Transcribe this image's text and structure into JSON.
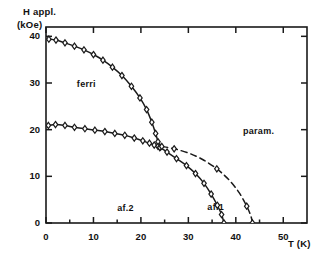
{
  "chart_data": {
    "type": "line",
    "title": "",
    "subtitle": "",
    "xlabel": "T (K)",
    "ylabel_line1": "H appl.",
    "ylabel_line2": "(kOe)",
    "xlim": [
      0,
      55
    ],
    "ylim": [
      0,
      42
    ],
    "xticks": [
      0,
      10,
      20,
      30,
      40,
      50
    ],
    "xtick_labels": [
      "0",
      "10",
      "20",
      "30",
      "40",
      "50"
    ],
    "yticks": [
      0,
      10,
      20,
      30,
      40
    ],
    "ytick_labels": [
      "0",
      "10",
      "20",
      "30",
      "40"
    ],
    "minor_xticks": [
      5,
      15,
      25,
      35,
      45
    ],
    "grid": false,
    "legend": "none",
    "frame": "box-with-inward-ticks",
    "annotations": [
      {
        "text": "ferri",
        "x": 6.5,
        "y": 29.5
      },
      {
        "text": "af.2",
        "x": 15.0,
        "y": 3.0
      },
      {
        "text": "af.1",
        "x": 34.0,
        "y": 3.2
      },
      {
        "text": "param.",
        "x": 41.5,
        "y": 19.5
      }
    ],
    "series": [
      {
        "name": "ferri-af.1 boundary (upper)",
        "style": "solid-with-open-diamond-markers",
        "marker": "open-diamond",
        "points": [
          [
            0.6,
            39.4
          ],
          [
            2.1,
            39.2
          ],
          [
            4.0,
            38.6
          ],
          [
            6.0,
            37.9
          ],
          [
            8.0,
            37.1
          ],
          [
            10.0,
            36.1
          ],
          [
            12.0,
            34.9
          ],
          [
            14.0,
            33.4
          ],
          [
            16.0,
            31.6
          ],
          [
            18.0,
            29.3
          ],
          [
            19.8,
            26.8
          ],
          [
            21.2,
            24.3
          ],
          [
            22.3,
            21.6
          ],
          [
            23.1,
            19.2
          ],
          [
            23.6,
            17.4
          ],
          [
            24.0,
            16.2
          ]
        ]
      },
      {
        "name": "ferri-af.2 boundary (lower)",
        "style": "solid-with-open-diamond-markers",
        "marker": "open-diamond",
        "points": [
          [
            0.5,
            20.9
          ],
          [
            2.0,
            21.1
          ],
          [
            4.0,
            20.9
          ],
          [
            6.0,
            20.5
          ],
          [
            8.2,
            20.2
          ],
          [
            10.3,
            19.9
          ],
          [
            12.4,
            19.6
          ],
          [
            14.5,
            19.2
          ],
          [
            16.6,
            18.8
          ],
          [
            18.6,
            18.2
          ],
          [
            20.4,
            17.6
          ],
          [
            21.8,
            17.1
          ],
          [
            22.8,
            16.7
          ],
          [
            23.6,
            16.4
          ],
          [
            24.0,
            16.2
          ]
        ]
      },
      {
        "name": "af.2 / af.1 - param boundary (solid)",
        "style": "solid-with-open-diamond-markers",
        "marker": "open-diamond",
        "points": [
          [
            24.0,
            16.2
          ],
          [
            25.5,
            15.2
          ],
          [
            27.5,
            13.8
          ],
          [
            29.6,
            12.3
          ],
          [
            31.5,
            10.6
          ],
          [
            33.3,
            8.5
          ],
          [
            34.8,
            6.2
          ],
          [
            36.1,
            3.8
          ],
          [
            37.0,
            1.8
          ],
          [
            37.5,
            0.0
          ]
        ]
      },
      {
        "name": "upper transition (dashed)",
        "style": "dashed-with-open-diamond-markers",
        "marker": "open-diamond",
        "points": [
          [
            24.4,
            16.4
          ],
          [
            27.0,
            15.9
          ],
          [
            30.0,
            15.0
          ],
          [
            33.0,
            13.6
          ],
          [
            36.0,
            11.6
          ],
          [
            38.6,
            9.2
          ],
          [
            40.7,
            6.5
          ],
          [
            42.3,
            3.6
          ],
          [
            43.2,
            1.4
          ],
          [
            43.5,
            0.0
          ]
        ]
      }
    ],
    "marker_points_dashed": [
      [
        27.0,
        15.9
      ],
      [
        36.0,
        11.6
      ]
    ],
    "marker_points_solid_right": [
      [
        27.5,
        13.8
      ],
      [
        33.3,
        8.5
      ]
    ]
  }
}
